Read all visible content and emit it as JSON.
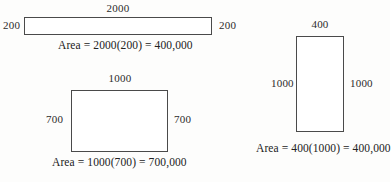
{
  "figures": [
    {
      "id": "fig1",
      "shape": "rectangle",
      "top_label": "2000",
      "left_label": "200",
      "right_label": "200",
      "area_text": "Area = 2000(200) = 400,000",
      "width_value": 2000,
      "height_value": 200,
      "area_value": 400000
    },
    {
      "id": "fig2",
      "shape": "rectangle",
      "top_label": "1000",
      "left_label": "700",
      "right_label": "700",
      "area_text": "Area = 1000(700) = 700,000",
      "width_value": 1000,
      "height_value": 700,
      "area_value": 700000
    },
    {
      "id": "fig3",
      "shape": "rectangle",
      "top_label": "400",
      "left_label": "1000",
      "right_label": "1000",
      "area_text": "Area = 400(1000) = 400,000",
      "width_value": 400,
      "height_value": 1000,
      "area_value": 400000
    }
  ],
  "style": {
    "stroke_color": "#4a4a4a",
    "text_color": "#222222",
    "background_color": "#fdfdfc"
  }
}
